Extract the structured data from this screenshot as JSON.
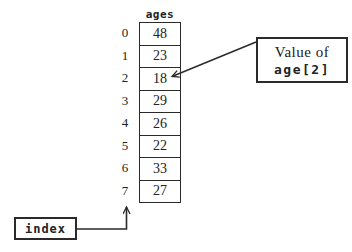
{
  "diagram": {
    "array": {
      "title": "ages",
      "rows": [
        {
          "index": "0",
          "value": "48"
        },
        {
          "index": "1",
          "value": "23"
        },
        {
          "index": "2",
          "value": "18"
        },
        {
          "index": "3",
          "value": "29"
        },
        {
          "index": "4",
          "value": "26"
        },
        {
          "index": "5",
          "value": "22"
        },
        {
          "index": "6",
          "value": "33"
        },
        {
          "index": "7",
          "value": "27"
        }
      ]
    },
    "callout": {
      "line1": "Value of",
      "line2": "age[2]"
    },
    "index_box_label": "index",
    "colors": {
      "ink": "#222222",
      "background": "#ffffff"
    }
  }
}
